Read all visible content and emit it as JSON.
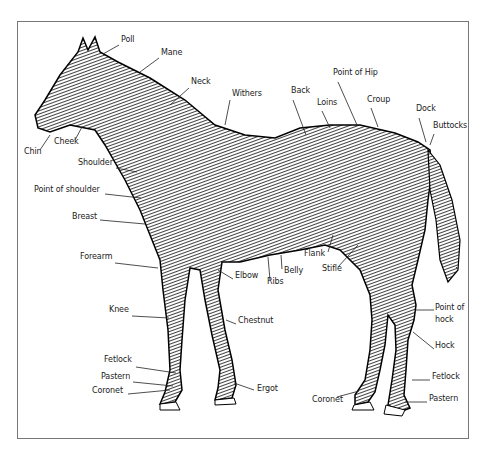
{
  "diagram": {
    "labels": [
      {
        "id": "poll",
        "text": "Poll",
        "x": 121,
        "y": 40
      },
      {
        "id": "mane",
        "text": "Mane",
        "x": 161,
        "y": 53
      },
      {
        "id": "neck",
        "text": "Neck",
        "x": 191,
        "y": 82
      },
      {
        "id": "withers",
        "text": "Withers",
        "x": 232,
        "y": 94
      },
      {
        "id": "back",
        "text": "Back",
        "x": 291,
        "y": 91
      },
      {
        "id": "loins",
        "text": "Loins",
        "x": 317,
        "y": 103
      },
      {
        "id": "point-of-hip",
        "text": "Point of Hip",
        "x": 333,
        "y": 73
      },
      {
        "id": "croup",
        "text": "Croup",
        "x": 367,
        "y": 100
      },
      {
        "id": "dock",
        "text": "Dock",
        "x": 416,
        "y": 109
      },
      {
        "id": "buttocks",
        "text": "Buttocks",
        "x": 433,
        "y": 126
      },
      {
        "id": "chin",
        "text": "Chin",
        "x": 24,
        "y": 152
      },
      {
        "id": "cheek",
        "text": "Cheek",
        "x": 54,
        "y": 142
      },
      {
        "id": "shoulder",
        "text": "Shoulder",
        "x": 78,
        "y": 163
      },
      {
        "id": "point-of-shoulder",
        "text": "Point of shoulder",
        "x": 34,
        "y": 190
      },
      {
        "id": "breast",
        "text": "Breast",
        "x": 72,
        "y": 217
      },
      {
        "id": "flank",
        "text": "Flank",
        "x": 304,
        "y": 254
      },
      {
        "id": "stifle",
        "text": "Stifle",
        "x": 322,
        "y": 269
      },
      {
        "id": "belly",
        "text": "Belly",
        "x": 284,
        "y": 271
      },
      {
        "id": "ribs",
        "text": "Ribs",
        "x": 267,
        "y": 282
      },
      {
        "id": "elbow",
        "text": "Elbow",
        "x": 235,
        "y": 276
      },
      {
        "id": "forearm",
        "text": "Forearm",
        "x": 80,
        "y": 257
      },
      {
        "id": "knee",
        "text": "Knee",
        "x": 109,
        "y": 310
      },
      {
        "id": "chestnut",
        "text": "Chestnut",
        "x": 238,
        "y": 321
      },
      {
        "id": "point-of-hock",
        "text": "Point of hock",
        "x": 435,
        "y": 306,
        "multiline": [
          "Point of",
          "hock"
        ]
      },
      {
        "id": "hock",
        "text": "Hock",
        "x": 435,
        "y": 346
      },
      {
        "id": "fetlock-front",
        "text": "Fetlock",
        "x": 104,
        "y": 360
      },
      {
        "id": "pastern-front",
        "text": "Pastern",
        "x": 101,
        "y": 377
      },
      {
        "id": "coronet-front",
        "text": "Coronet",
        "x": 92,
        "y": 391
      },
      {
        "id": "ergot",
        "text": "Ergot",
        "x": 257,
        "y": 389
      },
      {
        "id": "fetlock-hind",
        "text": "Fetlock",
        "x": 432,
        "y": 377
      },
      {
        "id": "coronet-hind",
        "text": "Coronet",
        "x": 312,
        "y": 400
      },
      {
        "id": "pastern-hind",
        "text": "Pastern",
        "x": 429,
        "y": 399
      }
    ]
  }
}
